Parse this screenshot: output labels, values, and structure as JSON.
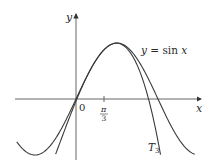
{
  "figure": {
    "type": "function-graph",
    "axes": {
      "x_label": "x",
      "y_label": "y",
      "origin_label": "0",
      "tick": {
        "numerator": "π",
        "denominator": "3",
        "value": "π/3"
      }
    },
    "curves": [
      {
        "name": "sin",
        "label": "y = sin x",
        "label_parts": {
          "lhs": "y",
          "eq": " = sin ",
          "var": "x"
        }
      },
      {
        "name": "taylor-T3",
        "label": "T3",
        "label_parts": {
          "main": "T",
          "sub": "3"
        }
      }
    ],
    "colors": {
      "curve": "#3a3a3a",
      "axis": "#555555",
      "text": "#2a2a2a"
    }
  }
}
